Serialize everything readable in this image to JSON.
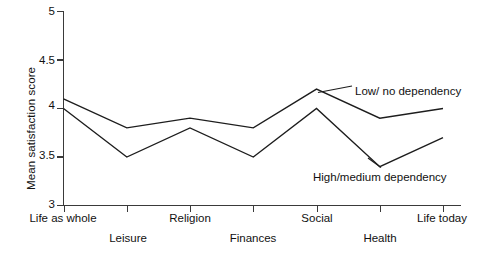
{
  "chart_data": {
    "type": "line",
    "title": "",
    "subtitle": "",
    "xlabel": "",
    "ylabel": "Mean satisfaction score",
    "categories": [
      "Life as whole",
      "Leisure",
      "Religion",
      "Finances",
      "Social",
      "Health",
      "Life today"
    ],
    "ylim": [
      3,
      5
    ],
    "yticks": [
      3,
      3.5,
      4,
      4.5,
      5
    ],
    "ytick_labels": [
      "3",
      "3.5",
      "4",
      "4.5",
      "5"
    ],
    "grid": false,
    "legend_position": "inline-annotation",
    "series": [
      {
        "name": "Low/ no dependency",
        "values": [
          4.1,
          3.8,
          3.9,
          3.8,
          4.2,
          3.9,
          4.0
        ]
      },
      {
        "name": "High/medium dependency",
        "values": [
          4.0,
          3.5,
          3.8,
          3.5,
          4.0,
          3.4,
          3.7
        ]
      }
    ],
    "annotations": [
      {
        "text": "Low/ no dependency",
        "series": "Low/ no dependency"
      },
      {
        "text": "High/medium dependency",
        "series": "High/medium dependency"
      }
    ]
  },
  "axis": {
    "y_label": "Mean satisfaction score",
    "y_ticks": [
      "5",
      "4.5",
      "4",
      "3.5",
      "3"
    ],
    "x_ticks_row_top": [
      "Life as whole",
      "Religion",
      "Social",
      "Life today"
    ],
    "x_ticks_row_bottom": [
      "Leisure",
      "Finances",
      "Health"
    ]
  },
  "labels": {
    "series_low": "Low/ no dependency",
    "series_high": "High/medium dependency"
  },
  "colors": {
    "line": "#1d1d1d",
    "axis": "#3a3a3a",
    "background": "#ffffff",
    "text": "#111111"
  }
}
